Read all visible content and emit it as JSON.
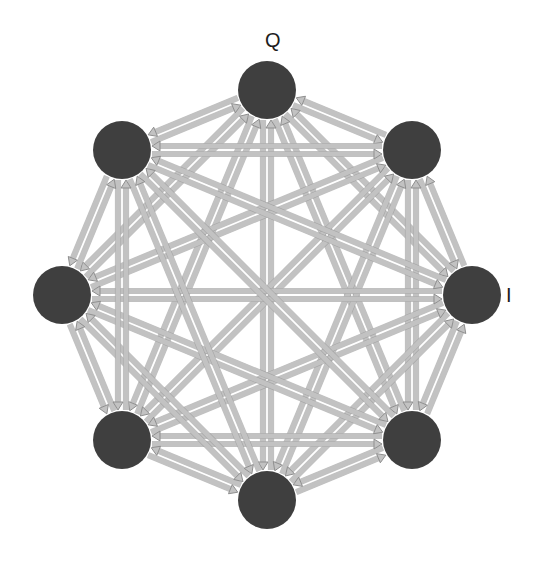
{
  "figure": {
    "kind": "directed-complete-graph-diagram",
    "background_color": "#ffffff",
    "width": 541,
    "height": 562
  },
  "graph": {
    "node_count": 8,
    "edge_style": "bidirectional-double-arrow",
    "layout": "regular-octagon",
    "center": {
      "x": 267,
      "y": 295
    },
    "radius": 205,
    "node_radius": 29,
    "node_fill": "#3f3f3f",
    "edge_fill": "#c2c2c2",
    "edge_stroke": "#8f8f8f",
    "edge_width": 5,
    "arrow_size": 8,
    "nodes": [
      {
        "id": "n0",
        "label": "Q",
        "label_position": "top",
        "angle_deg": -90,
        "x": 267,
        "y": 90
      },
      {
        "id": "n1",
        "label": "",
        "label_position": "none",
        "angle_deg": -45,
        "x": 412,
        "y": 150
      },
      {
        "id": "n2",
        "label": "I",
        "label_position": "right",
        "angle_deg": 0,
        "x": 472,
        "y": 295
      },
      {
        "id": "n3",
        "label": "",
        "label_position": "none",
        "angle_deg": 45,
        "x": 412,
        "y": 440
      },
      {
        "id": "n4",
        "label": "",
        "label_position": "none",
        "angle_deg": 90,
        "x": 267,
        "y": 500
      },
      {
        "id": "n5",
        "label": "",
        "label_position": "none",
        "angle_deg": 135,
        "x": 122,
        "y": 440
      },
      {
        "id": "n6",
        "label": "",
        "label_position": "none",
        "angle_deg": 180,
        "x": 62,
        "y": 295
      },
      {
        "id": "n7",
        "label": "",
        "label_position": "none",
        "angle_deg": 225,
        "x": 122,
        "y": 150
      }
    ],
    "labels": [
      {
        "text": "Q",
        "x": 265,
        "y": 30,
        "node": "n0"
      },
      {
        "text": "I",
        "x": 506,
        "y": 285,
        "node": "n2"
      }
    ]
  }
}
